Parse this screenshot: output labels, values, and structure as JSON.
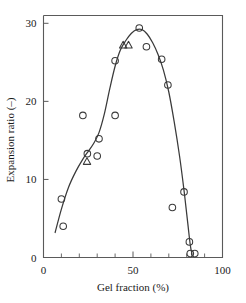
{
  "chart_data": {
    "type": "scatter",
    "title": "",
    "xlabel": "Gel fraction (%)",
    "ylabel": "Expansion ratio (–)",
    "xlim": [
      0,
      100
    ],
    "ylim": [
      0,
      31
    ],
    "grid": false,
    "legend": "none",
    "xticks": [
      0,
      50,
      100
    ],
    "xtick_labels": [
      "0",
      "50",
      "100"
    ],
    "xminor_step": 10,
    "yticks": [
      0,
      10,
      20,
      30
    ],
    "ytick_labels": [
      "0",
      "10",
      "20",
      "30"
    ],
    "series": [
      {
        "name": "circle-data",
        "marker": "circle",
        "points": [
          [
            11.0,
            4.0
          ],
          [
            10.0,
            7.5
          ],
          [
            22.0,
            18.2
          ],
          [
            24.5,
            13.3
          ],
          [
            30.0,
            13.0
          ],
          [
            31.0,
            15.2
          ],
          [
            40.0,
            18.2
          ],
          [
            40.0,
            25.2
          ],
          [
            53.5,
            29.4
          ],
          [
            57.5,
            27.0
          ],
          [
            66.0,
            25.4
          ],
          [
            69.5,
            22.1
          ],
          [
            72.0,
            6.4
          ],
          [
            78.5,
            8.4
          ],
          [
            81.5,
            2.0
          ],
          [
            82.0,
            0.5
          ],
          [
            84.5,
            0.5
          ]
        ]
      },
      {
        "name": "triangle-data",
        "marker": "triangle",
        "points": [
          [
            24.3,
            12.3
          ],
          [
            44.5,
            27.2
          ],
          [
            47.5,
            27.2
          ]
        ]
      }
    ],
    "curve": [
      [
        6.5,
        3.2
      ],
      [
        10.0,
        6.2
      ],
      [
        14.0,
        9.0
      ],
      [
        18.0,
        11.0
      ],
      [
        22.0,
        12.6
      ],
      [
        25.0,
        13.6
      ],
      [
        28.0,
        14.6
      ],
      [
        31.0,
        16.0
      ],
      [
        34.0,
        18.4
      ],
      [
        37.0,
        21.6
      ],
      [
        40.0,
        24.5
      ],
      [
        43.0,
        26.6
      ],
      [
        46.0,
        27.8
      ],
      [
        49.0,
        28.7
      ],
      [
        52.0,
        29.2
      ],
      [
        55.0,
        29.2
      ],
      [
        58.0,
        28.6
      ],
      [
        61.0,
        27.5
      ],
      [
        64.0,
        26.0
      ],
      [
        67.0,
        24.0
      ],
      [
        70.0,
        21.2
      ],
      [
        73.0,
        17.4
      ],
      [
        76.0,
        13.0
      ],
      [
        78.5,
        8.6
      ],
      [
        80.5,
        4.6
      ],
      [
        82.0,
        1.6
      ],
      [
        83.0,
        0.4
      ]
    ]
  }
}
